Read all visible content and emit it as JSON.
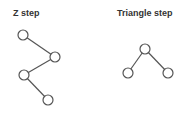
{
  "diagrams": [
    {
      "title": "Z step",
      "nodes": [
        {
          "x": 23,
          "y": 35
        },
        {
          "x": 55,
          "y": 57
        },
        {
          "x": 24,
          "y": 75
        },
        {
          "x": 48,
          "y": 100
        }
      ],
      "edges": [
        [
          0,
          1
        ],
        [
          1,
          2
        ],
        [
          2,
          3
        ]
      ]
    },
    {
      "title": "Triangle step",
      "nodes": [
        {
          "x": 145,
          "y": 49
        },
        {
          "x": 128,
          "y": 73
        },
        {
          "x": 168,
          "y": 73
        }
      ],
      "edges": [
        [
          0,
          1
        ],
        [
          0,
          2
        ]
      ]
    }
  ],
  "colors": {
    "stroke": "#555555",
    "node_fill": "#ffffff",
    "title": "#333333"
  }
}
